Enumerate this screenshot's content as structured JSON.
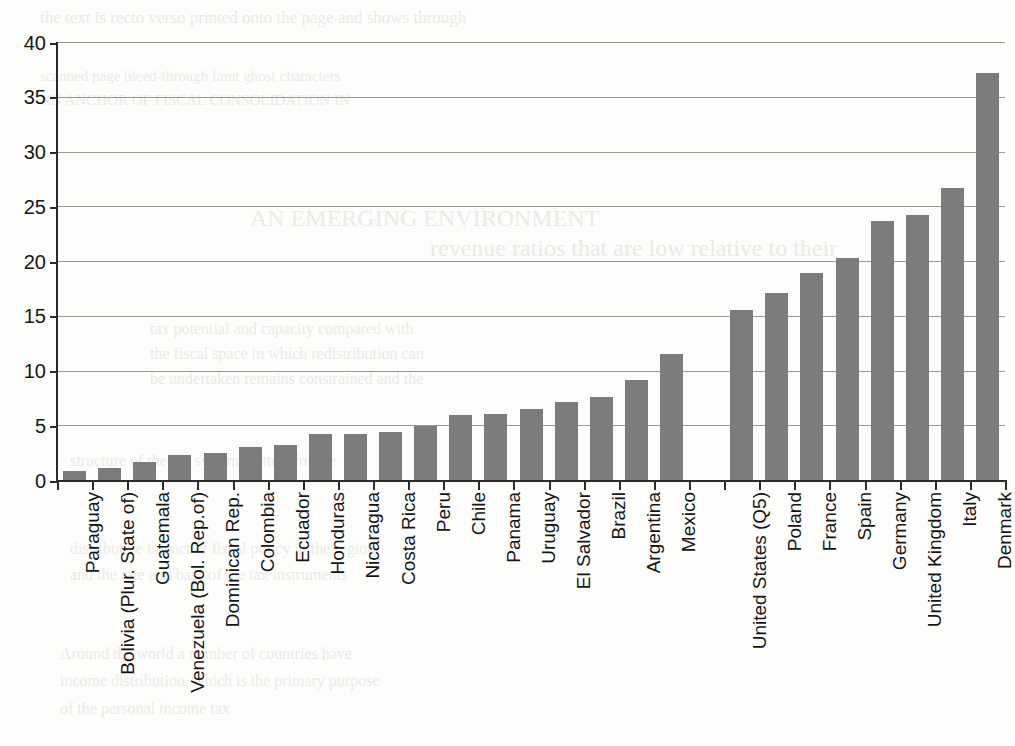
{
  "chart_data": {
    "type": "bar",
    "title": "",
    "subtitle": "",
    "xlabel": "",
    "ylabel": "",
    "ylim": [
      0,
      40
    ],
    "yticks": [
      0,
      5,
      10,
      15,
      20,
      25,
      30,
      35,
      40
    ],
    "ytick_labels": [
      "0",
      "5",
      "10",
      "15",
      "20",
      "25",
      "30",
      "35",
      "40"
    ],
    "grid": true,
    "legend": false,
    "legend_position": "none",
    "bar_color": "#7c7c7c",
    "axis_color": "#2b2b2b",
    "gridline_color": "#9a9a94",
    "gap_after_index": 18,
    "categories": [
      "Paraguay",
      "Bolivia (Plur. State of)",
      "Guatemala",
      "Venezuela (Bol. Rep.of)",
      "Dominican Rep.",
      "Colombia",
      "Ecuador",
      "Honduras",
      "Nicaragua",
      "Costa Rica",
      "Peru",
      "Chile",
      "Panama",
      "Uruguay",
      "El Salvador",
      "Brazil",
      "Argentina",
      "Mexico",
      "",
      "United States (Q5)",
      "Poland",
      "France",
      "Spain",
      "Germany",
      "United Kingdom",
      "Italy",
      "Denmark"
    ],
    "values": [
      0.8,
      1.1,
      1.6,
      2.3,
      2.5,
      3.0,
      3.2,
      4.2,
      4.2,
      4.35,
      4.9,
      5.9,
      6.0,
      6.5,
      7.1,
      7.6,
      9.1,
      11.5,
      null,
      15.5,
      17.1,
      18.9,
      20.3,
      23.7,
      24.2,
      26.7,
      37.2
    ]
  },
  "bleed_text": {
    "lines": [
      "the text is recto verso printed onto the page and shows through",
      "scanned page bleed-through faint ghost characters",
      "AN ANCHOR OF FISCAL CONSOLIDATION IN",
      "AN EMERGING ENVIRONMENT",
      "revenue ratios that are low relative to their",
      "tax potential and capacity compared with",
      "the fiscal space in which redistribution can",
      "be undertaken remains constrained and the",
      "structure of the tax system matters for the",
      "distributive impact of fiscal policy in the region",
      "and the rate and base of the tax instruments",
      "Around the world a number of countries have",
      "income distribution, which is the primary purpose",
      "of the personal income tax"
    ]
  }
}
